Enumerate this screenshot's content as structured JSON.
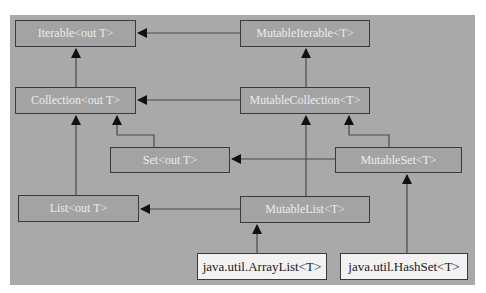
{
  "diagram": {
    "type": "class-hierarchy",
    "nodes": {
      "iterable": {
        "label": "Iterable<out T>",
        "kind": "interface"
      },
      "mutable_iterable": {
        "label": "MutableIterable<T>",
        "kind": "interface"
      },
      "collection": {
        "label": "Collection<out T>",
        "kind": "interface"
      },
      "mutable_collection": {
        "label": "MutableCollection<T>",
        "kind": "interface"
      },
      "set": {
        "label": "Set<out T>",
        "kind": "interface"
      },
      "mutable_set": {
        "label": "MutableSet<T>",
        "kind": "interface"
      },
      "list": {
        "label": "List<out T>",
        "kind": "interface"
      },
      "mutable_list": {
        "label": "MutableList<T>",
        "kind": "interface"
      },
      "array_list": {
        "label": "java.util.ArrayList<T>",
        "kind": "class"
      },
      "hash_set": {
        "label": "java.util.HashSet<T>",
        "kind": "class"
      }
    },
    "edges": [
      {
        "from": "MutableIterable<T>",
        "to": "Iterable<out T>"
      },
      {
        "from": "Collection<out T>",
        "to": "Iterable<out T>"
      },
      {
        "from": "MutableCollection<T>",
        "to": "MutableIterable<T>"
      },
      {
        "from": "MutableCollection<T>",
        "to": "Collection<out T>"
      },
      {
        "from": "Set<out T>",
        "to": "Collection<out T>"
      },
      {
        "from": "List<out T>",
        "to": "Collection<out T>"
      },
      {
        "from": "MutableSet<T>",
        "to": "Set<out T>"
      },
      {
        "from": "MutableSet<T>",
        "to": "MutableCollection<T>"
      },
      {
        "from": "MutableList<T>",
        "to": "List<out T>"
      },
      {
        "from": "MutableList<T>",
        "to": "MutableCollection<T>"
      },
      {
        "from": "java.util.ArrayList<T>",
        "to": "MutableList<T>"
      },
      {
        "from": "java.util.HashSet<T>",
        "to": "MutableSet<T>"
      }
    ],
    "colors": {
      "background": "#a9a9a9",
      "interface_fill": "#a3a3a3",
      "interface_text": "#ececec",
      "class_fill": "#f2f2f2",
      "class_text": "#1a1a1a",
      "line": "#3a3a3a"
    }
  }
}
